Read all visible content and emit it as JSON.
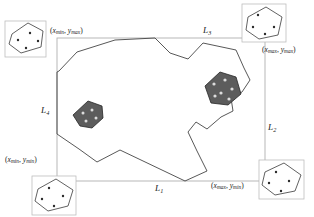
{
  "figure": {
    "type": "geometry-diagram",
    "colors": {
      "stroke": "#333333",
      "box_stroke": "#b3b3b3",
      "inset_stroke": "#3a3a3a",
      "shaded_fill": "#5a5a5a",
      "shaded_stroke": "#2b2b2b",
      "dot_light": "#d8d8d8",
      "dot_dark": "#2b2b2b",
      "background": "#ffffff",
      "text": "#1a1a1a"
    },
    "corner_labels": [
      {
        "name": "top-left",
        "open": "(",
        "x_var": "x",
        "x_sub": "min",
        "sep": ", ",
        "y_var": "y",
        "y_sub": "max",
        "close": ")",
        "text": "(xmin, ymax)"
      },
      {
        "name": "top-right",
        "open": "(",
        "x_var": "x",
        "x_sub": "max",
        "sep": ", ",
        "y_var": "y",
        "y_sub": "max",
        "close": ")",
        "text": "(xmax, ymax)"
      },
      {
        "name": "bottom-left",
        "open": "(",
        "x_var": "x",
        "x_sub": "min",
        "sep": ", ",
        "y_var": "y",
        "y_sub": "min",
        "close": ")",
        "text": "(xmin, ymin)"
      },
      {
        "name": "bottom-right",
        "open": "(",
        "x_var": "x",
        "x_sub": "max",
        "sep": ", ",
        "y_var": "y",
        "y_sub": "min",
        "close": ")",
        "text": "(xmax, ymin)"
      }
    ],
    "side_labels": [
      {
        "name": "bottom",
        "var": "L",
        "sub": "1",
        "text": "L1"
      },
      {
        "name": "right",
        "var": "L",
        "sub": "2",
        "text": "L2"
      },
      {
        "name": "top",
        "var": "L",
        "sub": "3",
        "text": "L3"
      },
      {
        "name": "left",
        "var": "L",
        "sub": "4",
        "text": "L4"
      }
    ],
    "bounding_box": {
      "x": 57,
      "y": 38,
      "width": 208,
      "height": 143
    },
    "main_polygon": {
      "name": "irregular-region",
      "points": "57,72 59,71 77,52 115,40 155,38 170,53 188,59 203,43 236,50 244,68 250,80 242,92 231,98 233,111 221,117 207,129 196,122 188,132 197,151 207,171 185,181 120,150 97,162 79,149 57,134"
    },
    "inner_shapes": [
      {
        "name": "shaded-polygon-small",
        "points": "73,115 88,101 102,106 103,118 92,128 80,126",
        "dots": [
          [
            83,
            113
          ],
          [
            92,
            110
          ],
          [
            96,
            118
          ],
          [
            86,
            121
          ]
        ]
      },
      {
        "name": "shaded-polygon-large",
        "points": "205,86 220,72 236,77 241,94 228,105 211,103",
        "dots": [
          [
            214,
            84
          ],
          [
            225,
            80
          ],
          [
            232,
            89
          ],
          [
            221,
            93
          ],
          [
            215,
            95
          ],
          [
            229,
            98
          ]
        ]
      }
    ],
    "insets": [
      {
        "name": "inset-top-left",
        "box": {
          "x": 5,
          "y": 21,
          "width": 41,
          "height": 36
        },
        "polygon": "12,34 28,23 43,31 41,47 21,53 9,44",
        "dots": [
          [
            18,
            40
          ],
          [
            30,
            33
          ],
          [
            38,
            40
          ],
          [
            26,
            47
          ]
        ]
      },
      {
        "name": "inset-top-right",
        "box": {
          "x": 242,
          "y": 4,
          "width": 44,
          "height": 38
        },
        "polygon": "248,17 266,7 282,17 278,35 259,39 246,30",
        "dots": [
          [
            258,
            15
          ],
          [
            253,
            27
          ],
          [
            265,
            34
          ],
          [
            274,
            27
          ]
        ]
      },
      {
        "name": "inset-bottom-right",
        "box": {
          "x": 259,
          "y": 160,
          "width": 45,
          "height": 39
        },
        "polygon": "265,172 284,163 301,175 295,191 275,195 262,185",
        "dots": [
          [
            276,
            172
          ],
          [
            269,
            183
          ],
          [
            281,
            191
          ],
          [
            289,
            181
          ]
        ]
      },
      {
        "name": "inset-bottom-left",
        "box": {
          "x": 32,
          "y": 176,
          "width": 44,
          "height": 39
        },
        "polygon": "38,189 56,179 73,190 68,206 48,211 35,201",
        "dots": [
          [
            49,
            188
          ],
          [
            42,
            199
          ],
          [
            54,
            206
          ],
          [
            63,
            196
          ]
        ]
      }
    ]
  }
}
